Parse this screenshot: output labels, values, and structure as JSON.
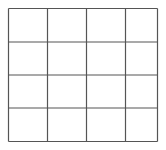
{
  "grid": {
    "rows": 4,
    "cols": 4,
    "x_lines": [
      8.5,
      47.5,
      86.5,
      125.5,
      157.5
    ],
    "y_lines": [
      8.5,
      42,
      75,
      108,
      141.5
    ],
    "line_color": "#555555",
    "background": "#ffffff"
  }
}
